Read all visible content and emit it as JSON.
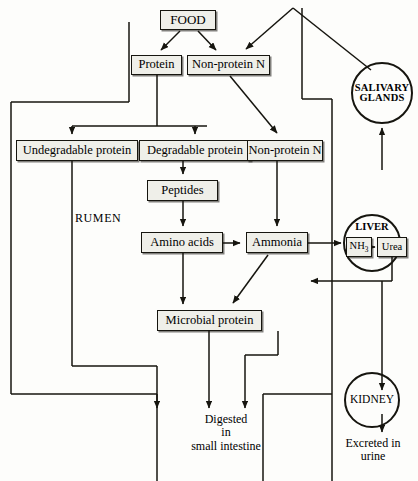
{
  "diagram": {
    "type": "flowchart",
    "stroke_color": "#16150f",
    "box_fill": "#efefe9",
    "background": "#fdfdfb"
  },
  "nodes": {
    "food": "FOOD",
    "protein": "Protein",
    "non_protein_n_top": "Non-protein N",
    "undegradable_protein": "Undegradable protein",
    "degradable_protein": "Degradable protein",
    "non_protein_n_mid": "Non-protein N",
    "peptides": "Peptides",
    "amino_acids": "Amino acids",
    "ammonia": "Ammonia",
    "microbial_protein": "Microbial protein",
    "nh3": "NH",
    "nh3_sub": "3",
    "urea": "Urea"
  },
  "organs": {
    "salivary_glands": "SALIVARY\nGLANDS",
    "liver": "LIVER",
    "kidney": "KIDNEY"
  },
  "labels": {
    "rumen": "RUMEN",
    "digested": "Digested\nin\nsmall intestine",
    "excreted": "Excreted in\nurine"
  }
}
